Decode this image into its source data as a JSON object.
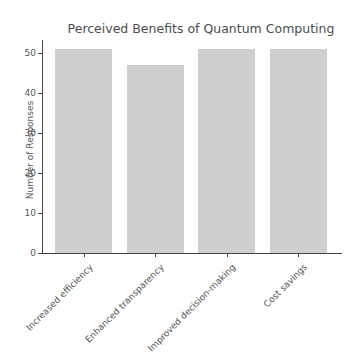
{
  "chart_data": {
    "type": "bar",
    "title": "Perceived Benefits of Quantum Computing",
    "xlabel": "",
    "ylabel": "Number of Responses",
    "categories": [
      "Increased efficiency",
      "Enhanced transparency",
      "Improved decision-making",
      "Cost savings"
    ],
    "values": [
      51,
      47,
      51,
      51
    ],
    "ylim": [
      0,
      53
    ],
    "yticks": [
      0,
      10,
      20,
      30,
      40,
      50
    ],
    "grid": false,
    "legend": null,
    "bar_color": "#cfcfcf"
  },
  "labels": {
    "title": "Perceived Benefits of Quantum Computing",
    "ylabel": "Number of Responses",
    "yticks": [
      "0",
      "10",
      "20",
      "30",
      "40",
      "50"
    ],
    "categories": [
      "Increased efficiency",
      "Enhanced transparency",
      "Improved decision-making",
      "Cost savings"
    ]
  }
}
